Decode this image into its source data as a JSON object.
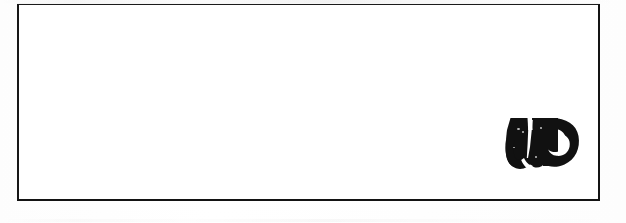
{
  "document": {
    "type": "scanned-document",
    "background_color": "#fefefe",
    "width": 626,
    "height": 223
  },
  "form_box": {
    "name": "blank-bordered-box",
    "border_color": "#171717",
    "fill_color": "#ffffff",
    "content_text": "",
    "left": 17,
    "top": 4,
    "width": 583,
    "height": 197
  },
  "logo": {
    "icon_name": "w-monogram-logo",
    "description": "bold w monogram merging into a c-shaped bowl",
    "color": "#111111",
    "counter_color": "#ffffff",
    "left": 492,
    "top": 113,
    "width": 75,
    "height": 52,
    "alt_text": ""
  }
}
